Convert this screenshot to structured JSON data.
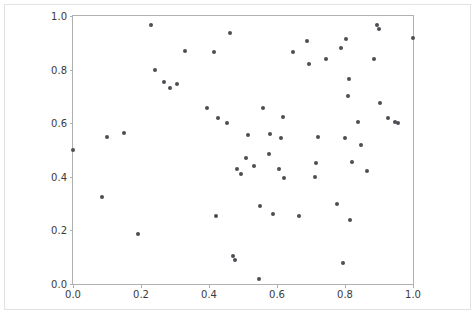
{
  "figure": {
    "background_color": "#ffffff",
    "axes_edge_color": "#b0b0b0",
    "tick_label_color": "#3b3b3b",
    "marker_color": "#4d4d54"
  },
  "chart_data": {
    "type": "scatter",
    "title": "",
    "xlabel": "",
    "ylabel": "",
    "xlim": [
      0.0,
      1.0
    ],
    "ylim": [
      0.0,
      1.0
    ],
    "grid": false,
    "legend": null,
    "xticks": [
      0.0,
      0.2,
      0.4,
      0.6,
      0.8,
      1.0
    ],
    "xticklabels": [
      "0.0",
      "0.2",
      "0.4",
      "0.6",
      "0.8",
      "1.0"
    ],
    "yticks": [
      0.0,
      0.2,
      0.4,
      0.6,
      0.8,
      1.0
    ],
    "yticklabels": [
      "0.0",
      "0.2",
      "0.4",
      "0.6",
      "0.8",
      "1.0"
    ],
    "marker": "circle",
    "marker_size": 4,
    "n_points": 62,
    "points": [
      [
        0.0,
        0.5
      ],
      [
        0.085,
        0.325
      ],
      [
        0.1,
        0.55
      ],
      [
        0.15,
        0.565
      ],
      [
        0.19,
        0.188
      ],
      [
        0.228,
        0.965
      ],
      [
        0.24,
        0.8
      ],
      [
        0.268,
        0.755
      ],
      [
        0.285,
        0.73
      ],
      [
        0.305,
        0.745
      ],
      [
        0.33,
        0.87
      ],
      [
        0.395,
        0.655
      ],
      [
        0.415,
        0.865
      ],
      [
        0.42,
        0.255
      ],
      [
        0.425,
        0.62
      ],
      [
        0.452,
        0.6
      ],
      [
        0.462,
        0.935
      ],
      [
        0.47,
        0.105
      ],
      [
        0.475,
        0.088
      ],
      [
        0.483,
        0.43
      ],
      [
        0.493,
        0.41
      ],
      [
        0.51,
        0.47
      ],
      [
        0.515,
        0.555
      ],
      [
        0.532,
        0.44
      ],
      [
        0.548,
        0.02
      ],
      [
        0.55,
        0.29
      ],
      [
        0.56,
        0.655
      ],
      [
        0.575,
        0.485
      ],
      [
        0.58,
        0.56
      ],
      [
        0.588,
        0.26
      ],
      [
        0.605,
        0.43
      ],
      [
        0.612,
        0.545
      ],
      [
        0.618,
        0.625
      ],
      [
        0.62,
        0.395
      ],
      [
        0.648,
        0.865
      ],
      [
        0.665,
        0.255
      ],
      [
        0.688,
        0.905
      ],
      [
        0.695,
        0.82
      ],
      [
        0.712,
        0.4
      ],
      [
        0.715,
        0.45
      ],
      [
        0.722,
        0.548
      ],
      [
        0.745,
        0.84
      ],
      [
        0.775,
        0.3
      ],
      [
        0.788,
        0.88
      ],
      [
        0.795,
        0.08
      ],
      [
        0.8,
        0.545
      ],
      [
        0.802,
        0.915
      ],
      [
        0.808,
        0.7
      ],
      [
        0.812,
        0.765
      ],
      [
        0.815,
        0.24
      ],
      [
        0.822,
        0.455
      ],
      [
        0.838,
        0.605
      ],
      [
        0.848,
        0.52
      ],
      [
        0.865,
        0.42
      ],
      [
        0.885,
        0.84
      ],
      [
        0.895,
        0.968
      ],
      [
        0.9,
        0.952
      ],
      [
        0.902,
        0.675
      ],
      [
        0.925,
        0.62
      ],
      [
        0.948,
        0.605
      ],
      [
        0.955,
        0.6
      ],
      [
        1.0,
        0.918
      ]
    ]
  }
}
